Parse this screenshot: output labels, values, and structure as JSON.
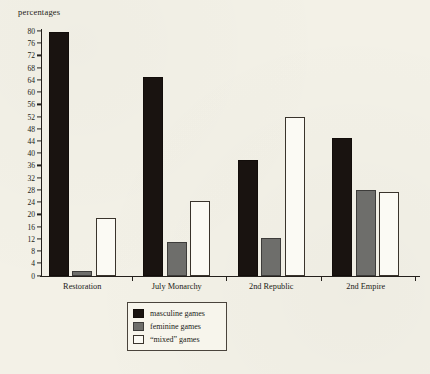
{
  "chart_data": {
    "type": "bar",
    "title": "",
    "ylabel": "percentages",
    "xlabel": "",
    "ylim": [
      0,
      80
    ],
    "ytick_step": 4,
    "grid": false,
    "legend_position": "below-plot",
    "categories": [
      "Restoration",
      "July Monarchy",
      "2nd Republic",
      "2nd Empire"
    ],
    "series": [
      {
        "name": "masculine games",
        "color": "#191310",
        "values": [
          80,
          65,
          38,
          45
        ]
      },
      {
        "name": "feminine games",
        "color": "#6e6e6b",
        "values": [
          1.5,
          11,
          12.5,
          28
        ]
      },
      {
        "name": "“mixed” games",
        "color": "#fbfaf4",
        "values": [
          19,
          24.5,
          52,
          27.5
        ]
      }
    ],
    "ytick_labels": [
      "0",
      "4",
      "8",
      "12",
      "16",
      "20",
      "24",
      "28",
      "32",
      "36",
      "40",
      "44",
      "48",
      "52",
      "56",
      "60",
      "64",
      "68",
      "72",
      "76",
      "80"
    ]
  },
  "legend": {
    "items": [
      {
        "label": "masculine games",
        "swatch": "masculine"
      },
      {
        "label": "feminine games",
        "swatch": "feminine"
      },
      {
        "label": "“mixed” games",
        "swatch": "mixed"
      }
    ]
  },
  "colors": {
    "page_background": "#f3f1e7",
    "ink": "#221c17",
    "masculine": "#191310",
    "feminine": "#6e6e6b",
    "mixed": "#fbfaf4"
  }
}
